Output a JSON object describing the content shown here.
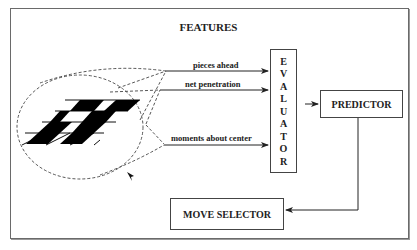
{
  "diagram": {
    "title": "FEATURES",
    "features": [
      {
        "label": "pieces ahead"
      },
      {
        "label": "net penetration"
      },
      {
        "label": "moments about center"
      }
    ],
    "evaluator": {
      "letters": [
        "E",
        "V",
        "A",
        "L",
        "U",
        "A",
        "T",
        "O",
        "R"
      ]
    },
    "predictor": {
      "label": "PREDICTOR"
    },
    "move_selector": {
      "label": "MOVE SELECTOR"
    },
    "colors": {
      "line": "#333333",
      "frame": "#6a6a6a",
      "fill": "#000000"
    }
  }
}
